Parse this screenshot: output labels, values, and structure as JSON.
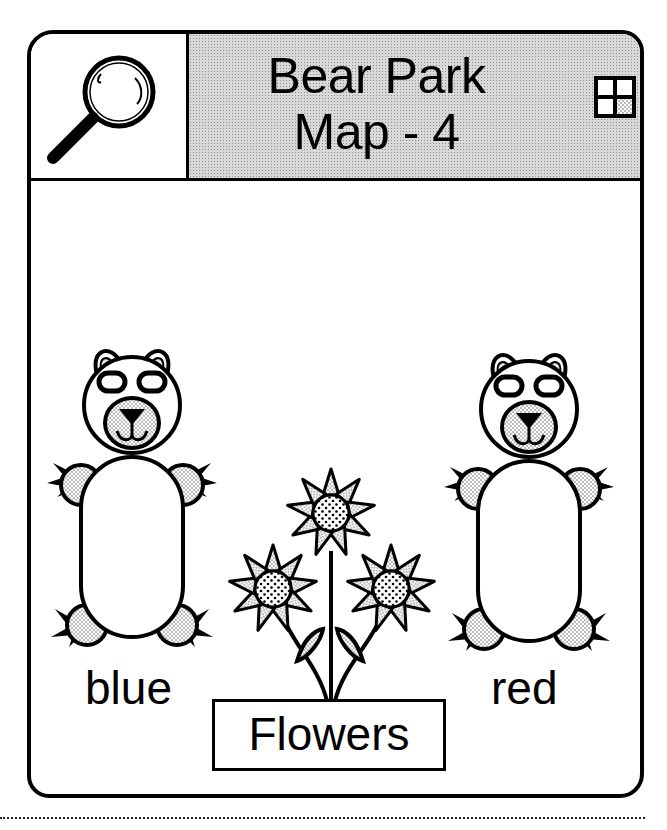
{
  "header": {
    "title_line1": "Bear Park",
    "title_line2": "Map - 4",
    "left_icon": "magnifying-glass-icon",
    "right_icon": "grid-quadrant-icon"
  },
  "scene": {
    "bears": [
      {
        "label": "blue",
        "position": "left"
      },
      {
        "label": "red",
        "position": "right"
      }
    ],
    "flowers": {
      "label": "Flowers",
      "count": 3
    }
  },
  "colors": {
    "ink": "#000000",
    "background": "#ffffff",
    "stipple": "#d9d9d9"
  }
}
